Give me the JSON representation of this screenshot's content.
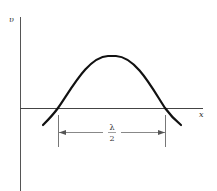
{
  "diagram": {
    "axes": {
      "y_label": "υ",
      "x_label": "x"
    },
    "annotation": {
      "numerator": "λ",
      "denominator": "2"
    },
    "colors": {
      "curve": "#111111",
      "axis": "#444444",
      "annotation": "#666666"
    }
  }
}
